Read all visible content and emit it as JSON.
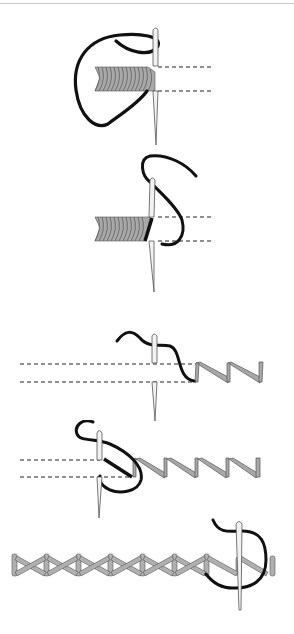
{
  "diagram": {
    "colors": {
      "thread": "#111111",
      "stitch_fill": "#a8a8a8",
      "stitch_stroke": "#555555",
      "needle_fill": "#f2f2f2",
      "needle_stroke": "#555555",
      "guide_line": "#222222",
      "top_rule": "#c8c8c8"
    },
    "steps": [
      {
        "index": 1,
        "description": "satin stitch block, thread looping left, needle at right edge"
      },
      {
        "index": 2,
        "description": "satin stitch block, needle inserted, thread wrapping over edge"
      },
      {
        "index": 3,
        "description": "needle between guide lines starting zig-zag stitch"
      },
      {
        "index": 4,
        "description": "zig-zag stitch row with looping thread"
      },
      {
        "index": 5,
        "description": "completed crossed (herringbone) stitch band with needle at end"
      }
    ]
  }
}
